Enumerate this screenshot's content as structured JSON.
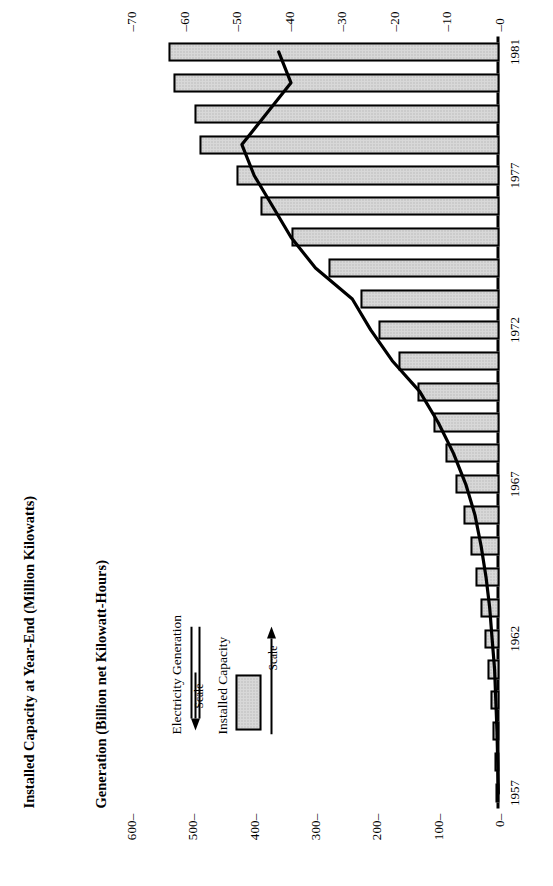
{
  "chart_data": {
    "type": "bar",
    "title": "",
    "axis_titles": {
      "generation": "Generation (Billion net Kilowatt-Hours)",
      "capacity": "Installed Capacity at Year-End (Million Kilowatts)"
    },
    "xlabel": "",
    "categories": [
      1957,
      1958,
      1959,
      1960,
      1961,
      1962,
      1963,
      1964,
      1965,
      1966,
      1967,
      1968,
      1969,
      1970,
      1971,
      1972,
      1973,
      1974,
      1975,
      1976,
      1977,
      1978,
      1979,
      1980,
      1981
    ],
    "x_tick_labels": [
      "1957",
      "1962",
      "1967",
      "1972",
      "1977",
      "1981"
    ],
    "x_tick_values": [
      1957,
      1962,
      1967,
      1972,
      1977,
      1981
    ],
    "grid": false,
    "legend_position": "upper-left",
    "series": [
      {
        "name": "Installed Capacity",
        "type": "bar",
        "axis": "right",
        "unit": "Million Kilowatts",
        "ylim": [
          0,
          70
        ],
        "yticks": [
          0,
          10,
          20,
          30,
          40,
          50,
          60,
          70
        ],
        "ytick_labels": [
          "0",
          "10",
          "20",
          "30",
          "40",
          "50",
          "60",
          "70"
        ],
        "values": [
          0.6,
          1.0,
          1.4,
          1.8,
          2.3,
          2.9,
          3.6,
          4.5,
          5.5,
          6.8,
          8.3,
          10.2,
          12.5,
          15.6,
          19.3,
          23.0,
          26.5,
          32.5,
          39.5,
          45.5,
          50.0,
          57.0,
          58.0,
          62.0,
          63.0
        ]
      },
      {
        "name": "Electricity Generation",
        "type": "line",
        "axis": "left",
        "unit": "Billion net Kilowatt-Hours",
        "ylim": [
          0,
          600
        ],
        "yticks": [
          0,
          100,
          200,
          300,
          400,
          500,
          600
        ],
        "ytick_labels": [
          "0",
          "100",
          "200",
          "300",
          "400",
          "500",
          "600"
        ],
        "values": [
          2,
          3,
          4,
          6,
          8,
          12,
          16,
          22,
          30,
          40,
          55,
          75,
          100,
          130,
          175,
          210,
          240,
          300,
          340,
          370,
          400,
          420,
          380,
          340,
          360
        ]
      }
    ]
  },
  "legend": {
    "items": [
      {
        "label": "Electricity Generation",
        "symbol": "line",
        "scale_label": "Scale",
        "scale_direction": "left"
      },
      {
        "label": "Installed Capacity",
        "symbol": "shaded-box",
        "scale_label": "Scale",
        "scale_direction": "right"
      }
    ]
  },
  "colors": {
    "bar_fill": "#d8d8d8",
    "bar_stroke": "#000000",
    "line": "#000000",
    "background": "#ffffff"
  }
}
